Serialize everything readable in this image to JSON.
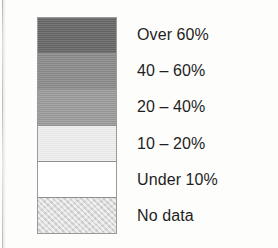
{
  "figure": {
    "kind": "map-legend",
    "background_color": "#fdfdfc",
    "border_color": "#9a9a9a"
  },
  "legend": {
    "entries": [
      {
        "label": "Over 60%",
        "color": "#666666",
        "swatch_name": "swatch-over-60"
      },
      {
        "label": "40 – 60%",
        "color": "#8a8a8a",
        "swatch_name": "swatch-40-60"
      },
      {
        "label": "20 – 40%",
        "color": "#9b9b9b",
        "swatch_name": "swatch-20-40"
      },
      {
        "label": "10 – 20%",
        "color": "#efefef",
        "swatch_name": "swatch-10-20"
      },
      {
        "label": "Under 10%",
        "color": "#ffffff",
        "swatch_name": "swatch-under-10"
      },
      {
        "label": "No data",
        "color": "#dcdcdc",
        "swatch_name": "swatch-no-data"
      }
    ]
  },
  "chart_data": {
    "type": "table",
    "title": "",
    "subtitle": "",
    "xlabel": "",
    "ylabel": "",
    "legend_position": "right",
    "grid": false,
    "categories": [
      "Over 60%",
      "40 – 60%",
      "20 – 40%",
      "10 – 20%",
      "Under 10%",
      "No data"
    ],
    "colors": [
      "#666666",
      "#8a8a8a",
      "#9b9b9b",
      "#efefef",
      "#ffffff",
      "#dcdcdc"
    ],
    "bins": [
      {
        "label": "Over 60%",
        "min": 60,
        "max": null,
        "unit": "%",
        "color": "#666666"
      },
      {
        "label": "40 – 60%",
        "min": 40,
        "max": 60,
        "unit": "%",
        "color": "#8a8a8a"
      },
      {
        "label": "20 – 40%",
        "min": 20,
        "max": 40,
        "unit": "%",
        "color": "#9b9b9b"
      },
      {
        "label": "10 – 20%",
        "min": 10,
        "max": 20,
        "unit": "%",
        "color": "#efefef"
      },
      {
        "label": "Under 10%",
        "min": null,
        "max": 10,
        "unit": "%",
        "color": "#ffffff"
      },
      {
        "label": "No data",
        "min": null,
        "max": null,
        "unit": "",
        "color": "#dcdcdc"
      }
    ]
  }
}
